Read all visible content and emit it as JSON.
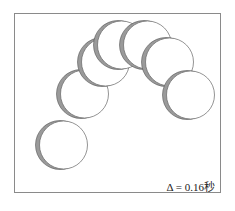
{
  "figure": {
    "caption_label": "Δ = 0.16秒",
    "frame_color": "#8a8a8a",
    "ball_count": 7
  },
  "balls": [
    {
      "cx": 60,
      "cy": 145
    },
    {
      "cx": 81,
      "cy": 94
    },
    {
      "cx": 102,
      "cy": 62
    },
    {
      "cx": 118,
      "cy": 45
    },
    {
      "cx": 144,
      "cy": 45
    },
    {
      "cx": 166,
      "cy": 62
    },
    {
      "cx": 187,
      "cy": 95
    }
  ]
}
